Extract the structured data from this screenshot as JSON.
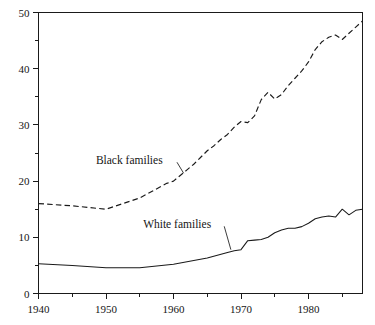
{
  "chart_data": {
    "type": "line",
    "title": "",
    "subtitle": "",
    "xlabel": "",
    "ylabel": "",
    "xlim": [
      1940,
      1988
    ],
    "ylim": [
      0,
      50
    ],
    "grid": false,
    "legend_position": "inline-annotations",
    "y_ticks_major": [
      0,
      10,
      20,
      30,
      40,
      50
    ],
    "y_ticks_minor": [
      5,
      15,
      25,
      35,
      45
    ],
    "y_tick_labels": [
      "0",
      "10",
      "20",
      "30",
      "40",
      "50"
    ],
    "x_ticks_major": [
      1940,
      1950,
      1960,
      1970,
      1980
    ],
    "x_ticks_minor": [
      1945,
      1955,
      1965,
      1975,
      1985
    ],
    "x_tick_labels": [
      "1940",
      "1950",
      "1960",
      "1970",
      "1980"
    ],
    "annotations": [
      {
        "name": "black-families-label",
        "text": "Black families",
        "x": 1948.5,
        "y": 23.0,
        "points_to_x": 1961.5,
        "points_to_y": 21.4
      },
      {
        "name": "white-families-label",
        "text": "White families",
        "x": 1955.5,
        "y": 11.6,
        "points_to_x": 1968.5,
        "points_to_y": 7.8
      }
    ],
    "series": [
      {
        "name": "Black families",
        "style": "dashed",
        "x": [
          1940,
          1945,
          1950,
          1955,
          1959,
          1960,
          1961,
          1962,
          1963,
          1964,
          1965,
          1966,
          1967,
          1968,
          1969,
          1970,
          1971,
          1972,
          1973,
          1974,
          1975,
          1976,
          1977,
          1978,
          1979,
          1980,
          1981,
          1982,
          1983,
          1984,
          1985,
          1986,
          1987,
          1988
        ],
        "values": [
          16.0,
          15.6,
          15.0,
          17.0,
          19.6,
          20.0,
          21.0,
          22.0,
          23.0,
          24.2,
          25.4,
          26.3,
          27.4,
          28.3,
          29.6,
          30.6,
          30.4,
          31.6,
          34.5,
          35.8,
          34.6,
          35.4,
          37.0,
          38.3,
          39.6,
          41.2,
          43.4,
          44.8,
          45.6,
          46.0,
          45.2,
          46.3,
          47.4,
          48.5
        ]
      },
      {
        "name": "White families",
        "style": "solid",
        "x": [
          1940,
          1945,
          1950,
          1955,
          1960,
          1965,
          1968,
          1969,
          1970,
          1971,
          1972,
          1973,
          1974,
          1975,
          1976,
          1977,
          1978,
          1979,
          1980,
          1981,
          1982,
          1983,
          1984,
          1985,
          1986,
          1987,
          1988
        ],
        "values": [
          5.3,
          5.0,
          4.6,
          4.6,
          5.2,
          6.3,
          7.3,
          7.6,
          7.8,
          9.4,
          9.5,
          9.6,
          10.0,
          10.8,
          11.3,
          11.6,
          11.6,
          11.9,
          12.5,
          13.3,
          13.6,
          13.8,
          13.6,
          15.0,
          14.0,
          14.8,
          15.0
        ]
      }
    ]
  }
}
